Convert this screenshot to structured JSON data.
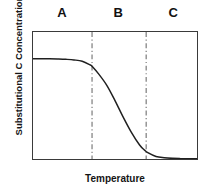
{
  "chart_data": {
    "type": "line",
    "title": "",
    "subtitle": "",
    "xlabel": "Temperature",
    "ylabel": "Substitutional C Concentration",
    "xlim": [
      0,
      100
    ],
    "ylim": [
      0,
      100
    ],
    "grid": false,
    "legend_position": "none",
    "axis_ticks": {
      "x": [],
      "y": []
    },
    "series": [
      {
        "name": "Substitutional C Concentration",
        "color": "#1f1f1f",
        "shape": "sigmoid-decreasing",
        "x": [
          0,
          5,
          10,
          15,
          20,
          25,
          30,
          35,
          36,
          40,
          45,
          50,
          55,
          60,
          65,
          68,
          70,
          75,
          80,
          85,
          90,
          95,
          100
        ],
        "y": [
          79,
          79,
          79,
          78.8,
          78.5,
          78,
          77,
          74,
          73,
          67,
          58,
          46,
          33,
          21,
          11,
          7,
          5,
          2,
          1,
          0.5,
          0.3,
          0.2,
          0.2
        ]
      }
    ],
    "annotations": {
      "region_dividers": [
        {
          "name": "divider-1",
          "x": 36,
          "style": "dash-dot",
          "color": "#6e6e6e"
        },
        {
          "name": "divider-2",
          "x": 69,
          "style": "dash-dot",
          "color": "#6e6e6e"
        }
      ],
      "region_labels": [
        {
          "name": "region-a",
          "label": "A",
          "x_center": 18
        },
        {
          "name": "region-b",
          "label": "B",
          "x_center": 52
        },
        {
          "name": "region-c",
          "label": "C",
          "x_center": 85
        }
      ]
    }
  },
  "regions": {
    "a": "A",
    "b": "B",
    "c": "C"
  },
  "axes": {
    "x_title": "Temperature",
    "y_title": "Substitutional C Concentration"
  },
  "colors": {
    "curve": "#1f1f1f",
    "frame": "#3a3a3a",
    "divider": "#6e6e6e",
    "background": "#ffffff",
    "text": "#151515"
  }
}
